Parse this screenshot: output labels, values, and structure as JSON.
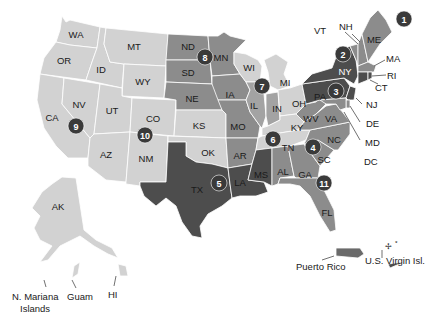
{
  "colors": {
    "light": "#d2d2d2",
    "light2": "#bdbdbd",
    "medium": "#8c8c8c",
    "medium2": "#a3a3a3",
    "dark": "#4d4d4d",
    "badge": "#3a3a3a",
    "background": "#ffffff"
  },
  "states": {
    "WA": "WA",
    "OR": "OR",
    "ID": "ID",
    "MT": "MT",
    "WY": "WY",
    "CA": "CA",
    "NV": "NV",
    "UT": "UT",
    "CO": "CO",
    "AZ": "AZ",
    "NM": "NM",
    "ND": "ND",
    "SD": "SD",
    "NE": "NE",
    "KS": "KS",
    "OK": "OK",
    "TX": "TX",
    "MN": "MN",
    "IA": "IA",
    "MO": "MO",
    "AR": "AR",
    "LA": "LA",
    "WI": "WI",
    "IL": "IL",
    "MI": "MI",
    "IN": "IN",
    "OH": "OH",
    "KY": "KY",
    "TN": "TN",
    "MS": "MS",
    "AL": "AL",
    "GA": "GA",
    "FL": "FL",
    "SC": "SC",
    "NC": "NC",
    "VA": "VA",
    "WV": "WV",
    "PA": "PA",
    "NY": "NY",
    "VT": "VT",
    "NH": "NH",
    "ME": "ME",
    "MA": "MA",
    "RI": "RI",
    "CT": "CT",
    "NJ": "NJ",
    "DE": "DE",
    "MD": "MD",
    "DC": "DC",
    "AK": "AK",
    "HI": "HI"
  },
  "territories": {
    "guam": "Guam",
    "nmi_line1": "N. Mariana",
    "nmi_line2": "Islands",
    "pr": "Puerto Rico",
    "vi": "U.S. Virgin Isl."
  },
  "regions": [
    {
      "number": "1",
      "x": 404,
      "y": 19
    },
    {
      "number": "2",
      "x": 343,
      "y": 54
    },
    {
      "number": "3",
      "x": 336,
      "y": 91
    },
    {
      "number": "4",
      "x": 313,
      "y": 147
    },
    {
      "number": "5",
      "x": 219,
      "y": 183
    },
    {
      "number": "6",
      "x": 273,
      "y": 139
    },
    {
      "number": "7",
      "x": 262,
      "y": 86
    },
    {
      "number": "8",
      "x": 205,
      "y": 57
    },
    {
      "number": "9",
      "x": 76,
      "y": 126
    },
    {
      "number": "10",
      "x": 145,
      "y": 135
    },
    {
      "number": "11",
      "x": 324,
      "y": 183
    }
  ]
}
